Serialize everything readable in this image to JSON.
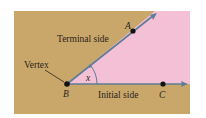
{
  "figure": {
    "colors": {
      "background": "#ffffff",
      "panel": "#C9A76B",
      "angle_region": "#F4C0D6",
      "ray": "#5E7C96",
      "point": "#111111",
      "text": "#2b2418"
    },
    "labels": {
      "terminal_side": "Terminal side",
      "initial_side": "Initial side",
      "vertex": "Vertex",
      "angle": "x",
      "point_a": "A",
      "point_b": "B",
      "point_c": "C"
    },
    "points": {
      "A": {
        "x": 133,
        "y": 31
      },
      "B": {
        "x": 67,
        "y": 84
      },
      "C": {
        "x": 163,
        "y": 84
      }
    }
  }
}
